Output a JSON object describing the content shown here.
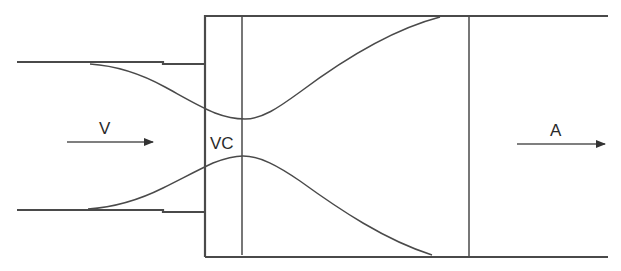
{
  "diagram": {
    "title": "",
    "labels": {
      "inlet_velocity": "V",
      "vena_contracta": "VC",
      "outlet_area": "A"
    },
    "arrows": [
      {
        "id": "inlet-arrow",
        "label": "V",
        "direction": "right"
      },
      {
        "id": "outlet-arrow",
        "label": "A",
        "direction": "right"
      }
    ],
    "colors": {
      "line": "#4a4a4a",
      "text": "#2a2a2a",
      "background": "#ffffff"
    }
  }
}
